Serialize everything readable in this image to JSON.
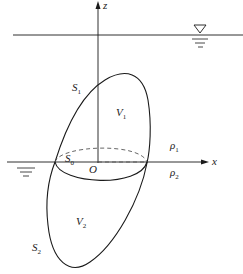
{
  "diagram": {
    "type": "floating body across two-fluid interface",
    "colors": {
      "stroke": "#1a1a1a",
      "background": "#ffffff",
      "dashed": "#555555"
    },
    "axes": {
      "z_label": "z",
      "x_label": "x",
      "origin_label": "O"
    },
    "surfaces": {
      "upper_surface": {
        "main": "S",
        "sub": "1"
      },
      "lower_surface": {
        "main": "S",
        "sub": "2"
      },
      "section": {
        "main": "S",
        "sub": "0"
      }
    },
    "volumes": {
      "upper": {
        "main": "V",
        "sub": "1"
      },
      "lower": {
        "main": "V",
        "sub": "2"
      }
    },
    "densities": {
      "upper": {
        "main": "ρ",
        "sub": "1"
      },
      "lower": {
        "main": "ρ",
        "sub": "2"
      }
    },
    "symbols": {
      "free_surface_marker": "water-level-triangle",
      "interface_marker": "water-level-lines"
    }
  }
}
